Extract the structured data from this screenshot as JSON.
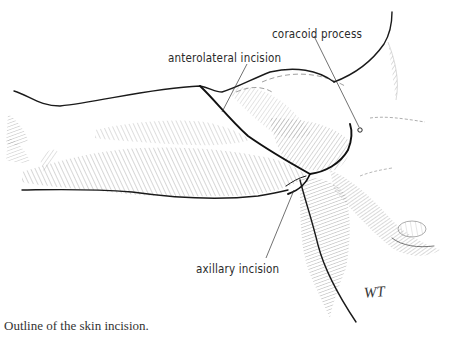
{
  "figure": {
    "labels": {
      "coracoid": "coracoid process",
      "anterolateral": "anterolateral incision",
      "axillary": "axillary incision"
    },
    "signature": "WT",
    "caption": "Outline of the skin incision."
  }
}
